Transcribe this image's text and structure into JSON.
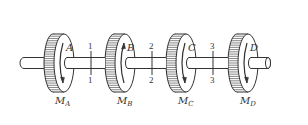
{
  "diagram": {
    "type": "shaft-with-disks-torsion",
    "colors": {
      "stroke": "#333333",
      "background": "#ffffff"
    },
    "shaft": {
      "y_center": 63,
      "radius": 5.5,
      "x_start": 20,
      "x_end": 268
    },
    "disks": [
      {
        "id": "A",
        "label": "A",
        "moment_label": "M",
        "moment_sub": "A",
        "cx": 64,
        "arrow": "down"
      },
      {
        "id": "B",
        "label": "B",
        "moment_label": "M",
        "moment_sub": "B",
        "cx": 125,
        "arrow": "up"
      },
      {
        "id": "C",
        "label": "C",
        "moment_label": "M",
        "moment_sub": "C",
        "cx": 186,
        "arrow": "down"
      },
      {
        "id": "D",
        "label": "D",
        "moment_label": "M",
        "moment_sub": "D",
        "cx": 248,
        "arrow": "down"
      }
    ],
    "sections": [
      {
        "id": "1",
        "top_label": "1",
        "bottom_label": "1",
        "x": 91
      },
      {
        "id": "2",
        "top_label": "2",
        "bottom_label": "2",
        "x": 152
      },
      {
        "id": "3",
        "top_label": "3",
        "bottom_label": "3",
        "x": 213
      }
    ]
  }
}
